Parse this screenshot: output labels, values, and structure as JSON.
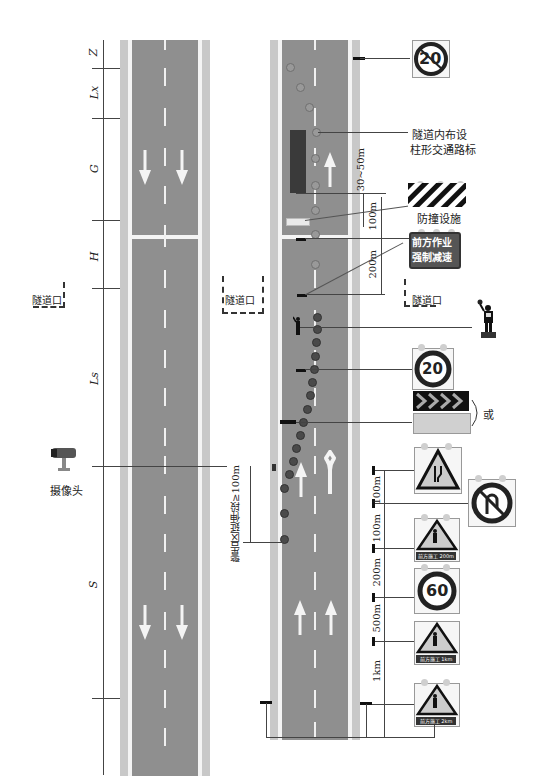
{
  "left_road": {
    "dimension_labels": [
      "Z",
      "Lx",
      "G",
      "H",
      "Ls",
      "S"
    ],
    "tunnel_label": "隧道口",
    "camera_label": "摄像头"
  },
  "right_road": {
    "tunnel_label_left": "隧道口",
    "tunnel_label_right": "隧道口",
    "post_delineator_label_line1": "隧道内布设",
    "post_delineator_label_line2": "柱形交通路标",
    "crash_barrier_label": "防撞设施",
    "warning_sign_line1": "前方作业",
    "warning_sign_line2": "强制减速",
    "or_label": "或",
    "warning_extension_label": "警告区延伸段≥100m",
    "distances": {
      "d_30_50": "30~50m",
      "d_100_a": "100m",
      "d_200_a": "200m",
      "d_100_b": "100m",
      "d_100_c": "100m",
      "d_200_b": "200m",
      "d_500": "500m",
      "d_1km": "1km"
    }
  },
  "signs": {
    "speed_limit_end_20": "20",
    "speed_limit_20": "20",
    "speed_limit_60": "60",
    "work_ahead_200m": "前方施工 200m",
    "work_ahead_1km": "前方施工 1km",
    "work_ahead_2km": "前方施工 2km"
  },
  "colors": {
    "road": "#8f8f8f",
    "shoulder": "#c8c8c8",
    "marking": "#f4f4f4",
    "sign_red_ring": "#2b2b2b",
    "cone": "#4a4a4a"
  }
}
